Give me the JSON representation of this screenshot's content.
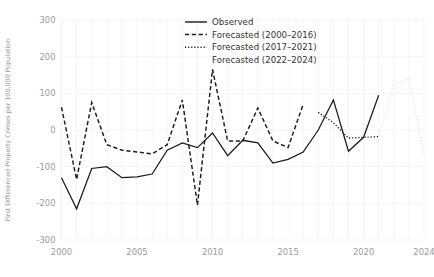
{
  "chart_data": {
    "type": "line",
    "title": "",
    "xlabel": "",
    "ylabel": "First Differenced Property Crimes per 100,000 Population",
    "xlim": [
      2000,
      2024
    ],
    "ylim": [
      -300,
      300
    ],
    "grid": true,
    "legend_position": "top-center",
    "xticks": [
      "2000",
      "2005",
      "2010",
      "2015",
      "2020",
      "2024"
    ],
    "xtick_values": [
      2000,
      2005,
      2010,
      2015,
      2020,
      2024
    ],
    "yticks": [
      "300",
      "200",
      "100",
      "0",
      "-100",
      "-200",
      "-300"
    ],
    "ytick_values": [
      300,
      200,
      100,
      0,
      -100,
      -200,
      -300
    ],
    "series": [
      {
        "name": "Observed",
        "style": "solid",
        "color": "#1b1b1b",
        "x": [
          2000,
          2001,
          2002,
          2003,
          2004,
          2005,
          2006,
          2007,
          2008,
          2009,
          2010,
          2011,
          2012,
          2013,
          2014,
          2015,
          2016,
          2017,
          2018,
          2019,
          2020,
          2021
        ],
        "values": [
          -130,
          -215,
          -105,
          -100,
          -130,
          -128,
          -120,
          -55,
          -35,
          -48,
          -8,
          -70,
          -28,
          -35,
          -90,
          -80,
          -60,
          0,
          82,
          -58,
          -20,
          95
        ]
      },
      {
        "name": "Forecasted (2000–2016)",
        "style": "dashed",
        "color": "#1b1b1b",
        "x": [
          2000,
          2001,
          2002,
          2003,
          2004,
          2005,
          2006,
          2007,
          2008,
          2009,
          2010,
          2011,
          2012,
          2013,
          2014,
          2015,
          2016
        ],
        "values": [
          62,
          -135,
          75,
          -40,
          -55,
          -60,
          -65,
          -40,
          82,
          -205,
          165,
          -30,
          -30,
          60,
          -30,
          -48,
          70
        ]
      },
      {
        "name": "Forecasted (2017–2021)",
        "style": "dotted",
        "color": "#1b1b1b",
        "x": [
          2017,
          2018,
          2019,
          2020,
          2021
        ],
        "values": [
          48,
          20,
          -22,
          -20,
          -18
        ]
      },
      {
        "name": "Forecasted (2022–2024)",
        "style": "dotted-light",
        "color": "#e2e2e2",
        "x": [
          2021,
          2022,
          2023,
          2024
        ],
        "values": [
          -18,
          125,
          140,
          -65
        ]
      }
    ]
  },
  "legend": {
    "items": [
      {
        "label": "Observed",
        "style": "solid"
      },
      {
        "label": "Forecasted (2000–2016)",
        "style": "dashed"
      },
      {
        "label": "Forecasted (2017–2021)",
        "style": "dotted"
      },
      {
        "label": "Forecasted (2022–2024)",
        "style": "none"
      }
    ]
  }
}
